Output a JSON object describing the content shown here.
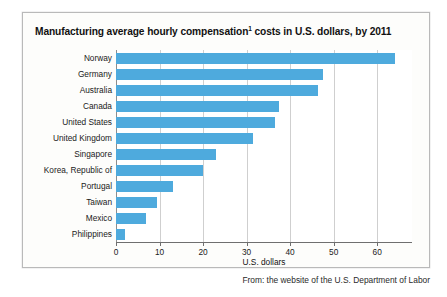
{
  "figure": {
    "title_prefix": "Manufacturing average hourly compensation",
    "title_superscript": "1",
    "title_suffix": " costs in U.S. dollars, by 2011",
    "title_full": "Manufacturing average hourly compensation1 costs in U.S. dollars, by 2011",
    "source_caption": "From: the website of the U.S. Department of Labor",
    "bar_color": "#4eaadd",
    "gridline_color": "#cfcfcf",
    "axis_color": "#6f6f6f",
    "frame_border_color": "#b9b9b9",
    "background_color": "#fdfdfb"
  },
  "chart_data": {
    "type": "bar",
    "orientation": "horizontal",
    "title": "Manufacturing average hourly compensation1 costs in U.S. dollars, by 2011",
    "xlabel": "U.S. dollars",
    "ylabel": "",
    "xlim": [
      0,
      68
    ],
    "ylim": null,
    "grid": true,
    "legend": false,
    "xticks": [
      0,
      10,
      20,
      30,
      40,
      50,
      60
    ],
    "xtick_labels": [
      "0",
      "10",
      "20",
      "30",
      "40",
      "50",
      "60"
    ],
    "categories": [
      "Norway",
      "Germany",
      "Australia",
      "Canada",
      "United States",
      "United Kingdom",
      "Singapore",
      "Korea, Republic of",
      "Portugal",
      "Taiwan",
      "Mexico",
      "Philippines"
    ],
    "values": [
      64,
      47.5,
      46.5,
      37.5,
      36.5,
      31.5,
      23,
      20,
      13,
      9.5,
      7,
      2
    ],
    "units": "U.S. dollars per hour",
    "annotations": []
  }
}
